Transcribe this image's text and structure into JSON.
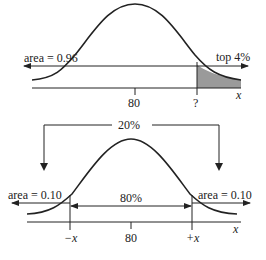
{
  "diagram_top": {
    "mean_label": "80",
    "unknown_label": "?",
    "axis_label": "x",
    "left_area_label": "area = 0.96",
    "right_label": "top 4%",
    "shade_color": "#9a9a9a"
  },
  "diagram_bottom": {
    "bracket_label": "20%",
    "center_label": "80%",
    "left_area_label": "area = 0.10",
    "right_area_label": "area = 0.10",
    "left_tick_label": "−x",
    "mean_label": "80",
    "right_tick_label": "+x",
    "axis_label": "x"
  },
  "colors": {
    "stroke": "#222222",
    "background": "#ffffff"
  }
}
